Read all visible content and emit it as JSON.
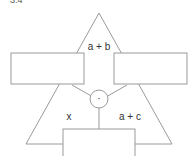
{
  "figure": {
    "number": "3.4"
  },
  "diagram": {
    "labels": {
      "top": "a + b",
      "left": "x",
      "right": "a + c",
      "center_node": "·"
    },
    "colors": {
      "stroke": "#9a9a9a",
      "text": "#333333",
      "background": "#ffffff"
    }
  }
}
